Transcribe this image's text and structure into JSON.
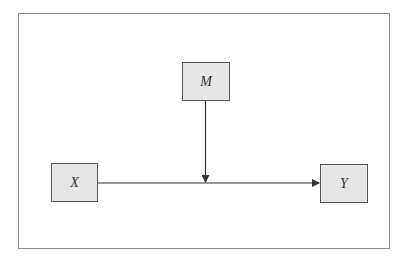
{
  "diagram": {
    "type": "moderation-model",
    "nodes": [
      {
        "id": "M",
        "label": "M",
        "role": "moderator"
      },
      {
        "id": "X",
        "label": "X",
        "role": "predictor"
      },
      {
        "id": "Y",
        "label": "Y",
        "role": "outcome"
      }
    ],
    "edges": [
      {
        "from": "X",
        "to": "Y",
        "style": "arrow"
      },
      {
        "from": "M",
        "to": "X->Y path",
        "style": "arrow"
      }
    ],
    "colors": {
      "node_fill": "#e6e6e6",
      "node_border": "#555555",
      "edge": "#333333",
      "frame": "#8a8a8a"
    }
  }
}
